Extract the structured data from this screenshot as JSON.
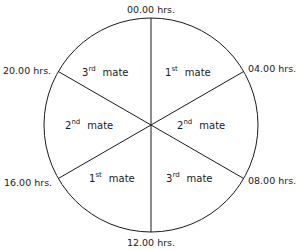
{
  "diagram": {
    "center": {
      "x": 151,
      "y": 125
    },
    "radius": 107,
    "line_color": "#1a1a1a",
    "time_labels": [
      {
        "id": "t0000",
        "text": "00.00 hrs.",
        "x": 151,
        "y": 13,
        "anchor": "middle"
      },
      {
        "id": "t0400",
        "text": "04.00 hrs.",
        "x": 248,
        "y": 72,
        "anchor": "start"
      },
      {
        "id": "t0800",
        "text": "08.00 hrs.",
        "x": 248,
        "y": 184,
        "anchor": "start"
      },
      {
        "id": "t1200",
        "text": "12.00 hrs.",
        "x": 151,
        "y": 246,
        "anchor": "middle"
      },
      {
        "id": "t1600",
        "text": "16.00 hrs.",
        "x": 4,
        "y": 186,
        "anchor": "start"
      },
      {
        "id": "t2000",
        "text": "20.00 hrs.",
        "x": 3,
        "y": 74,
        "anchor": "start"
      }
    ],
    "sectors": [
      {
        "id": "s1",
        "num": "1",
        "suffix": "st",
        "word": "mate",
        "x": 165,
        "y": 76,
        "period": "00.00–04.00"
      },
      {
        "id": "s2",
        "num": "2",
        "suffix": "nd",
        "word": "mate",
        "x": 177,
        "y": 129,
        "period": "04.00–08.00"
      },
      {
        "id": "s3",
        "num": "3",
        "suffix": "rd",
        "word": "mate",
        "x": 166,
        "y": 182,
        "period": "08.00–12.00"
      },
      {
        "id": "s4",
        "num": "1",
        "suffix": "st",
        "word": "mate",
        "x": 89,
        "y": 182,
        "period": "12.00–16.00"
      },
      {
        "id": "s5",
        "num": "2",
        "suffix": "nd",
        "word": "mate",
        "x": 65,
        "y": 129,
        "period": "16.00–20.00"
      },
      {
        "id": "s6",
        "num": "3",
        "suffix": "rd",
        "word": "mate",
        "x": 82,
        "y": 76,
        "period": "20.00–00.00"
      }
    ],
    "spokes_deg": [
      0,
      60,
      120,
      180,
      240,
      300
    ]
  }
}
